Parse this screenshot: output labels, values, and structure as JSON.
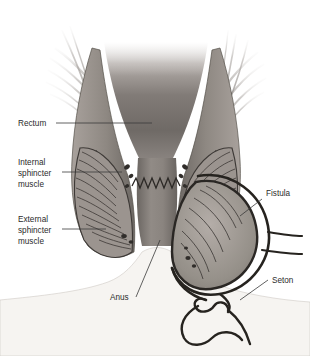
{
  "figure": {
    "background_color": "#ffffff"
  },
  "labels": [
    {
      "id": "rectum",
      "text": "Rectum",
      "x": 18,
      "y": 126
    },
    {
      "id": "internal-sphincter",
      "text": "Internal",
      "x": 18,
      "y": 165
    },
    {
      "id": "internal-sphincter2",
      "text": "sphincter",
      "x": 18,
      "y": 176
    },
    {
      "id": "internal-sphincter3",
      "text": "muscle",
      "x": 18,
      "y": 187
    },
    {
      "id": "external-sphincter",
      "text": "External",
      "x": 18,
      "y": 222
    },
    {
      "id": "external-sphincter2",
      "text": "sphincter",
      "x": 18,
      "y": 233
    },
    {
      "id": "external-sphincter3",
      "text": "muscle",
      "x": 18,
      "y": 244
    },
    {
      "id": "anus",
      "text": "Anus",
      "x": 110,
      "y": 300
    },
    {
      "id": "fistula",
      "text": "Fistula",
      "x": 266,
      "y": 196
    },
    {
      "id": "seton",
      "text": "Seton",
      "x": 272,
      "y": 283
    }
  ],
  "colors": {
    "label_text": "#2b2b2b",
    "leader_line": "#3a3a3a",
    "tissue_light": "#b9b2ad",
    "tissue_mid": "#8d8782",
    "tissue_dark": "#5d5854",
    "lumen_dark": "#4a4642",
    "outline": "#2e2b29",
    "skin": "#f4f2ef",
    "vessel": "#34302d",
    "seton_thread": "#26231f",
    "fistula_tract": "#2a2724"
  },
  "anatomy": {
    "structures": [
      "rectum",
      "internal sphincter muscle",
      "external sphincter muscle",
      "levator ani fibers",
      "dentate line",
      "anal canal",
      "anus",
      "fistula tract",
      "seton"
    ],
    "dentate_line": "zigzag line crossing the anal canal",
    "seton_description": "dark thread looped through the fistula tract and tied in a knot with two trailing tails"
  }
}
